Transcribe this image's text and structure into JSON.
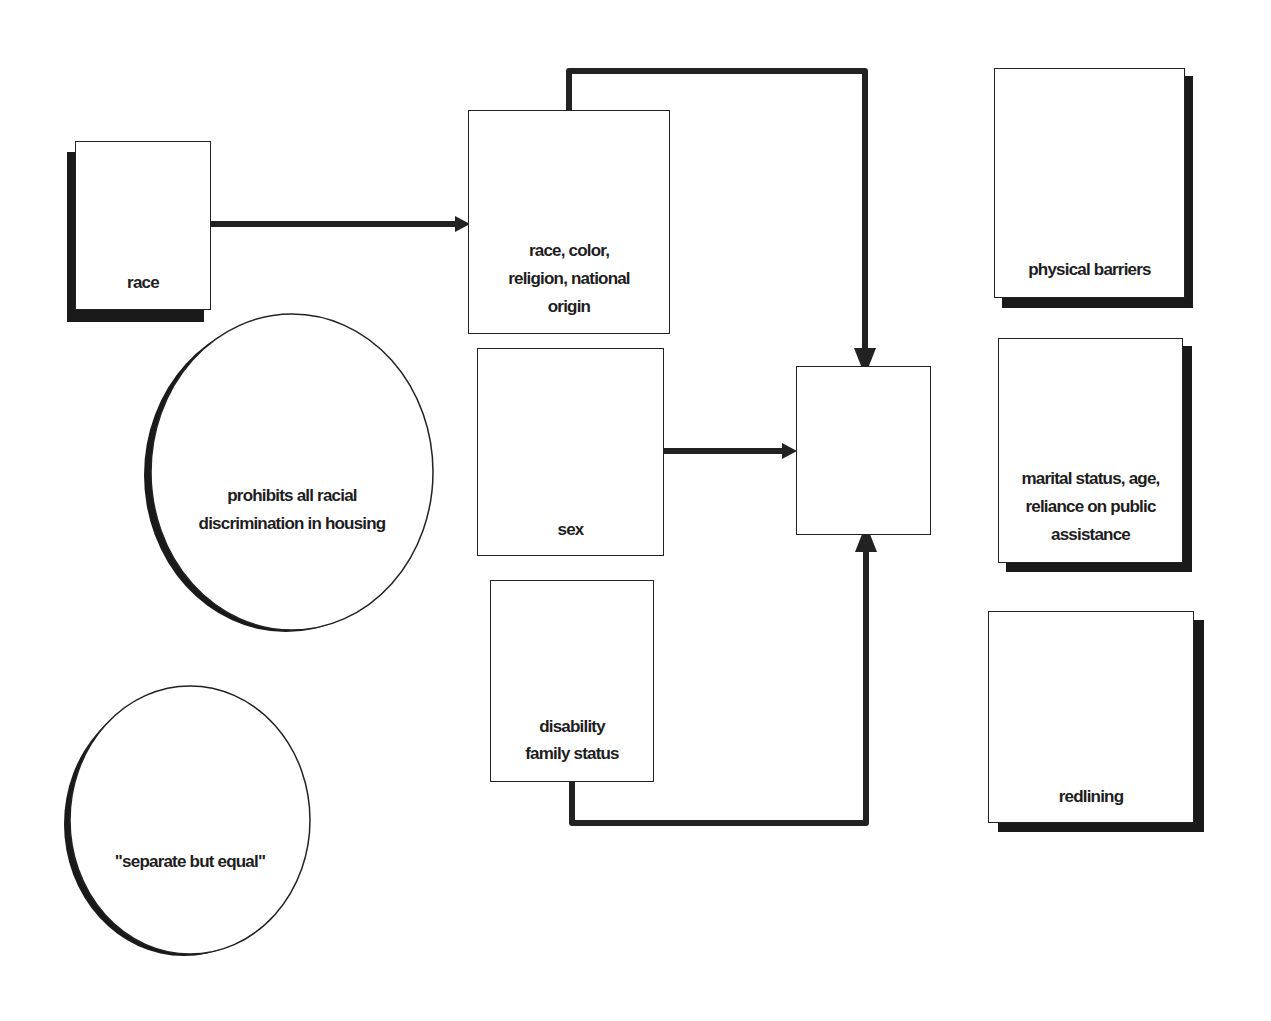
{
  "diagram": {
    "nodes": {
      "race": {
        "label": "race",
        "shape": "rect-shadow"
      },
      "protected_classes_1968": {
        "label": "race, color, religion, national origin",
        "lines": [
          "race, color,",
          "religion, national",
          "origin"
        ],
        "shape": "rect"
      },
      "sex": {
        "label": "sex",
        "shape": "rect"
      },
      "disability_family": {
        "label": "disability family status",
        "lines": [
          "disability",
          "family status"
        ],
        "shape": "rect"
      },
      "blank_target": {
        "label": "",
        "shape": "rect"
      },
      "prohibits_racial": {
        "label": "prohibits all racial discrimination in housing",
        "lines": [
          "prohibits all racial",
          "discrimination in housing"
        ],
        "shape": "ellipse-shadow"
      },
      "separate_equal": {
        "label": "\"separate but equal\"",
        "shape": "ellipse-shadow"
      },
      "physical_barriers": {
        "label": "physical barriers",
        "shape": "rect-shadow"
      },
      "marital_status": {
        "label": "marital status, age, reliance on public assistance",
        "lines": [
          "marital status, age,",
          "reliance on public",
          "assistance"
        ],
        "shape": "rect-shadow"
      },
      "redlining": {
        "label": "redlining",
        "shape": "rect-shadow"
      }
    },
    "edges": [
      {
        "from": "race",
        "to": "protected_classes_1968",
        "type": "arrow"
      },
      {
        "from": "protected_classes_1968",
        "to": "blank_target",
        "type": "elbow-arrow",
        "route": "over-top"
      },
      {
        "from": "sex",
        "to": "blank_target",
        "type": "arrow"
      },
      {
        "from": "disability_family",
        "to": "blank_target",
        "type": "elbow-arrow",
        "route": "under-bottom"
      }
    ],
    "colors": {
      "stroke": "#222222",
      "shadow": "#1a1a1a",
      "fill": "#ffffff",
      "text": "#1e1e1e"
    }
  }
}
